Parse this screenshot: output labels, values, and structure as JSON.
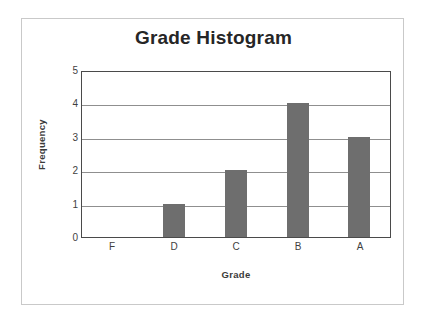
{
  "chart_data": {
    "type": "bar",
    "title": "Grade Histogram",
    "xlabel": "Grade",
    "ylabel": "Frequency",
    "categories": [
      "F",
      "D",
      "C",
      "B",
      "A"
    ],
    "values": [
      0,
      1,
      2,
      4,
      3
    ],
    "ylim": [
      0,
      5
    ],
    "yticks": [
      "5",
      "4",
      "3",
      "2",
      "1",
      "0"
    ],
    "grid": true,
    "legend": false,
    "bar_color": "#6e6e6e",
    "plot_border_color": "#4a4a4a",
    "gridline_color": "#8f8f8f",
    "frame_color": "#c9c9c9",
    "background_color": "#ffffff"
  }
}
